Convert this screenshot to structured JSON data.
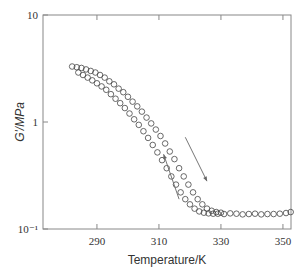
{
  "chart_data": {
    "type": "scatter",
    "title": "",
    "xlabel": "Temperature/K",
    "ylabel": "G'/MPa",
    "xlim": [
      272.6,
      352.6
    ],
    "ylim": [
      0.1,
      10
    ],
    "yscale": "log",
    "xticks": [
      290,
      310,
      330,
      350
    ],
    "yticks": [
      {
        "value": 10,
        "label": "10"
      },
      {
        "value": 1,
        "label": "1"
      },
      {
        "value": 0.1,
        "label": "10⁻¹"
      }
    ],
    "grid": false,
    "legend": null,
    "annotations": [
      {
        "type": "arrow",
        "direction": "down-right",
        "note": "heating branch",
        "from": [
          318.5,
          0.72
        ],
        "to": [
          325.5,
          0.28
        ]
      },
      {
        "type": "arrow",
        "direction": "up-left",
        "note": "cooling branch",
        "from": [
          316.5,
          0.19
        ],
        "to": [
          311.5,
          0.5
        ]
      }
    ],
    "series": [
      {
        "name": "upper branch",
        "marker": "open-circle",
        "x": [
          282,
          283.5,
          285,
          286.5,
          288,
          289.5,
          291,
          292.5,
          294,
          295.5,
          297,
          298.5,
          300,
          301.5,
          303,
          304.5,
          306,
          307.5,
          309,
          310.5,
          312,
          313.5,
          315,
          316.5,
          318,
          319.5,
          321,
          322.5,
          324,
          325.5,
          327,
          328.5,
          330
        ],
        "y": [
          3.3,
          3.25,
          3.2,
          3.1,
          3.0,
          2.9,
          2.75,
          2.6,
          2.4,
          2.25,
          2.05,
          1.9,
          1.72,
          1.55,
          1.4,
          1.25,
          1.1,
          0.97,
          0.85,
          0.74,
          0.63,
          0.53,
          0.45,
          0.37,
          0.31,
          0.26,
          0.22,
          0.19,
          0.17,
          0.155,
          0.148,
          0.144,
          0.142
        ]
      },
      {
        "name": "lower branch",
        "marker": "open-circle",
        "x": [
          284,
          285.5,
          287,
          288.5,
          290,
          291.5,
          293,
          294.5,
          296,
          297.5,
          299,
          300.5,
          302,
          303.5,
          305,
          306.5,
          308,
          309.5,
          311,
          312.5,
          314,
          315.5,
          317,
          318.5,
          320,
          321.5,
          323,
          324.5,
          326,
          327.5,
          329,
          331,
          333,
          335,
          337,
          339,
          341,
          343,
          345,
          347,
          349,
          351,
          352.5
        ],
        "y": [
          2.9,
          2.75,
          2.6,
          2.45,
          2.3,
          2.15,
          2.0,
          1.82,
          1.65,
          1.5,
          1.35,
          1.2,
          1.06,
          0.94,
          0.82,
          0.71,
          0.61,
          0.52,
          0.44,
          0.37,
          0.31,
          0.26,
          0.22,
          0.19,
          0.17,
          0.155,
          0.146,
          0.142,
          0.14,
          0.139,
          0.139,
          0.138,
          0.14,
          0.139,
          0.137,
          0.138,
          0.139,
          0.137,
          0.138,
          0.138,
          0.139,
          0.141,
          0.144
        ]
      }
    ]
  }
}
